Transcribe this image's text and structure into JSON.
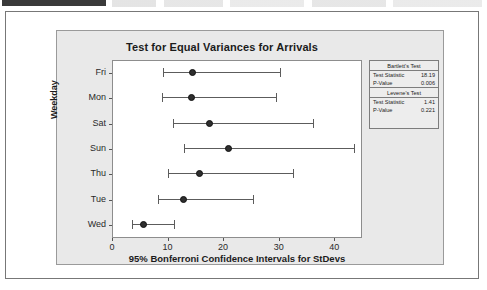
{
  "window": {
    "top_strip_present": true
  },
  "chart_data": {
    "type": "interval",
    "title": "Test for Equal Variances for Arrivals",
    "xlabel": "95% Bonferroni Confidence Intervals for StDevs",
    "ylabel": "Weekday",
    "categories": [
      "Fri",
      "Mon",
      "Sat",
      "Sun",
      "Thu",
      "Tue",
      "Wed"
    ],
    "xlim": [
      0,
      45
    ],
    "xticks": [
      0,
      10,
      20,
      30,
      40
    ],
    "grid": false,
    "legend": "none",
    "intervals": [
      {
        "category": "Fri",
        "lower": 9.2,
        "center": 14.5,
        "upper": 30.2
      },
      {
        "category": "Mon",
        "lower": 9.0,
        "center": 14.3,
        "upper": 29.5
      },
      {
        "category": "Sat",
        "lower": 11.0,
        "center": 17.5,
        "upper": 36.2
      },
      {
        "category": "Sun",
        "lower": 13.0,
        "center": 21.0,
        "upper": 43.5
      },
      {
        "category": "Thu",
        "lower": 10.0,
        "center": 15.8,
        "upper": 32.5
      },
      {
        "category": "Tue",
        "lower": 8.3,
        "center": 12.8,
        "upper": 25.3
      },
      {
        "category": "Wed",
        "lower": 3.6,
        "center": 5.6,
        "upper": 11.2
      }
    ],
    "annotations": {
      "bartlett": {
        "title": "Bartlett's Test",
        "test_statistic_label": "Test Statistic",
        "test_statistic": "18.19",
        "p_value_label": "P-Value",
        "p_value": "0.006"
      },
      "levene": {
        "title": "Levene's Test",
        "test_statistic_label": "Test Statistic",
        "test_statistic": "1.41",
        "p_value_label": "P-Value",
        "p_value": "0.221"
      }
    }
  },
  "colors": {
    "panel_background": "#e9e9e9",
    "plot_background": "#ffffff",
    "marker": "#2e2e2e",
    "line": "#5c5c5c",
    "border": "#8d8d8d"
  }
}
